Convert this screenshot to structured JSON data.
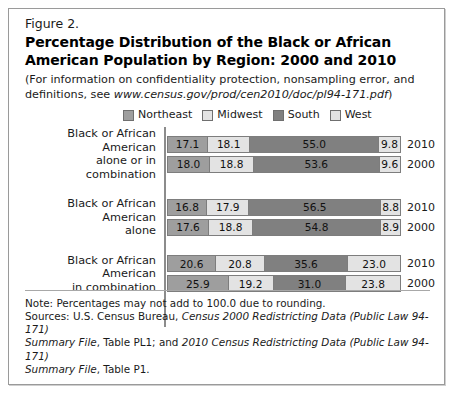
{
  "figure": {
    "number": "Figure 2.",
    "title": "Percentage Distribution of the Black or African American Population by Region: 2000 and 2010",
    "subtitle_prefix": "(For information on confidentiality protection, nonsampling error, and definitions, see ",
    "subtitle_url": "www.census.gov/prod/cen2010/doc/pl94-171.pdf",
    "subtitle_suffix": ")"
  },
  "colors": {
    "northeast": "#9e9e9e",
    "midwest": "#e3e3e3",
    "south": "#808080",
    "west": "#e3e3e3",
    "border": "#7d7d7d",
    "axis": "#8c8c8c",
    "frame": "#9a9a9a"
  },
  "footnotes": {
    "note": "Note: Percentages may not add to 100.0 due to rounding.",
    "sources_l1_a": "Sources: U.S. Census Bureau, ",
    "sources_l1_b": "Census 2000 Redistricting Data (Public Law 94-171)",
    "sources_l2_a": "Summary File",
    "sources_l2_b": ", Table PL1; and ",
    "sources_l2_c": "2010 Census Redistricting Data (Public Law 94-171)",
    "sources_l3_a": "Summary File",
    "sources_l3_b": ", Table P1."
  },
  "chart_data": {
    "type": "bar",
    "subtype": "stacked-horizontal-100pct",
    "title": "Percentage Distribution of the Black or African American Population by Region: 2000 and 2010",
    "xlabel": "",
    "ylabel": "",
    "xlim": [
      0,
      100
    ],
    "grid": false,
    "legend_position": "top",
    "legend": [
      {
        "name": "Northeast",
        "color": "#9e9e9e"
      },
      {
        "name": "Midwest",
        "color": "#e3e3e3"
      },
      {
        "name": "South",
        "color": "#808080"
      },
      {
        "name": "West",
        "color": "#e3e3e3"
      }
    ],
    "groups": [
      {
        "label_line1": "Black or African American",
        "label_line2": "alone or in combination",
        "rows": [
          {
            "year": "2010",
            "values": [
              17.1,
              18.1,
              55.0,
              9.8
            ]
          },
          {
            "year": "2000",
            "values": [
              18.0,
              18.8,
              53.6,
              9.6
            ]
          }
        ]
      },
      {
        "label_line1": "Black or African American",
        "label_line2": "alone",
        "rows": [
          {
            "year": "2010",
            "values": [
              16.8,
              17.9,
              56.5,
              8.8
            ]
          },
          {
            "year": "2000",
            "values": [
              17.6,
              18.8,
              54.8,
              8.9
            ]
          }
        ]
      },
      {
        "label_line1": "Black or African American",
        "label_line2": "in combination",
        "rows": [
          {
            "year": "2010",
            "values": [
              20.6,
              20.8,
              35.6,
              23.0
            ]
          },
          {
            "year": "2000",
            "values": [
              25.9,
              19.2,
              31.0,
              23.8
            ]
          }
        ]
      }
    ]
  }
}
